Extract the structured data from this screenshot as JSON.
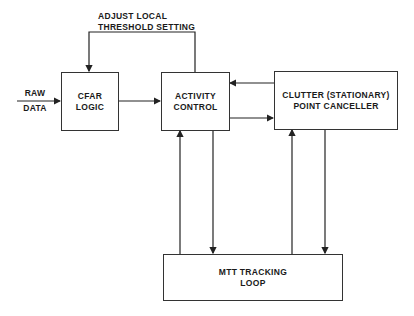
{
  "diagram": {
    "input_label": [
      "RAW",
      "DATA"
    ],
    "feedback_label": [
      "ADJUST LOCAL",
      "THRESHOLD SETTING"
    ],
    "blocks": {
      "cfar": [
        "CFAR",
        "LOGIC"
      ],
      "activity": [
        "ACTIVITY",
        "CONTROL"
      ],
      "clutter": [
        "CLUTTER (STATIONARY)",
        "POINT CANCELLER"
      ],
      "mtt": [
        "MTT TRACKING",
        "LOOP"
      ]
    },
    "connections": [
      {
        "from": "raw-data",
        "to": "cfar"
      },
      {
        "from": "cfar",
        "to": "activity"
      },
      {
        "from": "activity",
        "to": "cfar",
        "label": "ADJUST LOCAL THRESHOLD SETTING"
      },
      {
        "from": "clutter",
        "to": "activity"
      },
      {
        "from": "activity",
        "to": "clutter"
      },
      {
        "from": "mtt",
        "to": "activity"
      },
      {
        "from": "activity",
        "to": "mtt"
      },
      {
        "from": "mtt",
        "to": "clutter"
      },
      {
        "from": "clutter",
        "to": "mtt"
      }
    ]
  }
}
